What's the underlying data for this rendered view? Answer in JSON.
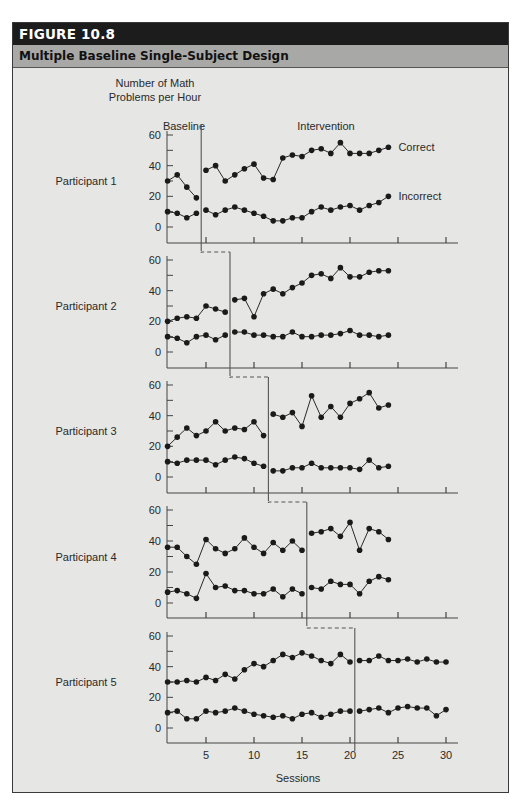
{
  "figure": {
    "number_label": "FIGURE 10.8",
    "title": "Multiple Baseline Single-Subject Design"
  },
  "axes": {
    "ylabel_line1": "Number of Math",
    "ylabel_line2": "Problems per Hour",
    "xlabel": "Sessions",
    "yticks": [
      0,
      20,
      40,
      60
    ],
    "xticks": [
      5,
      10,
      15,
      20,
      25,
      30
    ]
  },
  "phases": {
    "baseline_label": "Baseline",
    "intervention_label": "Intervention"
  },
  "legend": {
    "correct": "Correct",
    "incorrect": "Incorrect"
  },
  "colors": {
    "background": "#e6e6e4",
    "header": "#1c1c1c",
    "subtitle_bar": "#a8a8a6",
    "line": "#2a2a2a",
    "marker": "#1a1a1a"
  },
  "chart_data": {
    "type": "line",
    "title": "Multiple Baseline Single-Subject Design",
    "xlabel": "Sessions",
    "ylabel": "Number of Math Problems per Hour",
    "ylim": [
      0,
      60
    ],
    "xlim": [
      0,
      31
    ],
    "grid": false,
    "legend_position": "right of panel 1 lines",
    "panels": [
      {
        "label": "Participant 1",
        "phase_change_after_session": 4,
        "series": [
          {
            "name": "Correct",
            "x": [
              1,
              2,
              3,
              4,
              5,
              6,
              7,
              8,
              9,
              10,
              11,
              12,
              13,
              14,
              15,
              16,
              17,
              18,
              19,
              20,
              21,
              22,
              23,
              24
            ],
            "values": [
              30,
              34,
              26,
              19,
              37,
              40,
              30,
              34,
              38,
              41,
              32,
              31,
              45,
              47,
              46,
              50,
              51,
              48,
              55,
              48,
              48,
              48,
              50,
              52
            ]
          },
          {
            "name": "Incorrect",
            "x": [
              1,
              2,
              3,
              4,
              5,
              6,
              7,
              8,
              9,
              10,
              11,
              12,
              13,
              14,
              15,
              16,
              17,
              18,
              19,
              20,
              21,
              22,
              23,
              24
            ],
            "values": [
              10,
              9,
              6,
              9,
              11,
              8,
              11,
              13,
              11,
              9,
              7,
              4,
              4,
              6,
              6,
              10,
              13,
              11,
              13,
              14,
              11,
              14,
              16,
              20
            ]
          }
        ]
      },
      {
        "label": "Participant 2",
        "phase_change_after_session": 7,
        "series": [
          {
            "name": "Correct",
            "x": [
              1,
              2,
              3,
              4,
              5,
              6,
              7,
              8,
              9,
              10,
              11,
              12,
              13,
              14,
              15,
              16,
              17,
              18,
              19,
              20,
              21,
              22,
              23,
              24
            ],
            "values": [
              20,
              22,
              23,
              22,
              30,
              28,
              26,
              34,
              35,
              23,
              38,
              41,
              38,
              42,
              45,
              50,
              51,
              48,
              55,
              49,
              49,
              52,
              53,
              53
            ]
          },
          {
            "name": "Incorrect",
            "x": [
              1,
              2,
              3,
              4,
              5,
              6,
              7,
              8,
              9,
              10,
              11,
              12,
              13,
              14,
              15,
              16,
              17,
              18,
              19,
              20,
              21,
              22,
              23,
              24
            ],
            "values": [
              10,
              9,
              6,
              10,
              11,
              8,
              11,
              13,
              13,
              11,
              11,
              10,
              10,
              13,
              10,
              10,
              11,
              11,
              12,
              14,
              11,
              11,
              10,
              11
            ]
          }
        ]
      },
      {
        "label": "Participant 3",
        "phase_change_after_session": 11,
        "series": [
          {
            "name": "Correct",
            "x": [
              1,
              2,
              3,
              4,
              5,
              6,
              7,
              8,
              9,
              10,
              11,
              12,
              13,
              14,
              15,
              16,
              17,
              18,
              19,
              20,
              21,
              22,
              23,
              24
            ],
            "values": [
              20,
              26,
              32,
              27,
              30,
              36,
              30,
              32,
              31,
              36,
              27,
              41,
              39,
              42,
              33,
              53,
              39,
              46,
              39,
              48,
              51,
              55,
              45,
              47
            ]
          },
          {
            "name": "Incorrect",
            "x": [
              1,
              2,
              3,
              4,
              5,
              6,
              7,
              8,
              9,
              10,
              11,
              12,
              13,
              14,
              15,
              16,
              17,
              18,
              19,
              20,
              21,
              22,
              23,
              24
            ],
            "values": [
              10,
              9,
              11,
              11,
              11,
              8,
              11,
              13,
              12,
              9,
              7,
              4,
              4,
              6,
              6,
              9,
              6,
              6,
              6,
              6,
              5,
              11,
              6,
              7
            ]
          }
        ]
      },
      {
        "label": "Participant 4",
        "phase_change_after_session": 15,
        "series": [
          {
            "name": "Correct",
            "x": [
              1,
              2,
              3,
              4,
              5,
              6,
              7,
              8,
              9,
              10,
              11,
              12,
              13,
              14,
              15,
              16,
              17,
              18,
              19,
              20,
              21,
              22,
              23,
              24
            ],
            "values": [
              36,
              36,
              30,
              25,
              41,
              35,
              32,
              35,
              42,
              36,
              32,
              39,
              34,
              40,
              34,
              45,
              46,
              48,
              43,
              52,
              34,
              48,
              46,
              41
            ]
          },
          {
            "name": "Incorrect",
            "x": [
              1,
              2,
              3,
              4,
              5,
              6,
              7,
              8,
              9,
              10,
              11,
              12,
              13,
              14,
              15,
              16,
              17,
              18,
              19,
              20,
              21,
              22,
              23,
              24
            ],
            "values": [
              7,
              8,
              6,
              3,
              19,
              10,
              11,
              8,
              8,
              6,
              6,
              9,
              4,
              9,
              6,
              10,
              9,
              14,
              12,
              12,
              6,
              14,
              17,
              15
            ]
          }
        ]
      },
      {
        "label": "Participant 5",
        "phase_change_after_session": 20,
        "series": [
          {
            "name": "Correct",
            "x": [
              1,
              2,
              3,
              4,
              5,
              6,
              7,
              8,
              9,
              10,
              11,
              12,
              13,
              14,
              15,
              16,
              17,
              18,
              19,
              20,
              21,
              22,
              23,
              24,
              25,
              26,
              27,
              28,
              29,
              30
            ],
            "values": [
              30,
              30,
              31,
              30,
              33,
              31,
              35,
              32,
              38,
              42,
              40,
              44,
              48,
              46,
              49,
              47,
              44,
              42,
              48,
              43,
              44,
              44,
              47,
              44,
              44,
              45,
              43,
              45,
              43,
              43
            ]
          },
          {
            "name": "Incorrect",
            "x": [
              1,
              2,
              3,
              4,
              5,
              6,
              7,
              8,
              9,
              10,
              11,
              12,
              13,
              14,
              15,
              16,
              17,
              18,
              19,
              20,
              21,
              22,
              23,
              24,
              25,
              26,
              27,
              28,
              29,
              30
            ],
            "values": [
              10,
              11,
              6,
              6,
              11,
              10,
              11,
              13,
              11,
              9,
              8,
              7,
              8,
              6,
              9,
              10,
              7,
              9,
              11,
              11,
              11,
              12,
              13,
              10,
              13,
              14,
              13,
              13,
              8,
              12
            ]
          }
        ]
      }
    ]
  }
}
